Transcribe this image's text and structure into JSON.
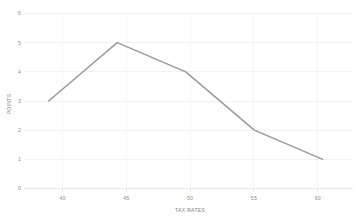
{
  "chart_data": {
    "type": "line",
    "title": "",
    "subtitle": "",
    "xlabel": "TAX RATES",
    "ylabel": "POINTS",
    "x": [
      40,
      45,
      50,
      55,
      60
    ],
    "categories": [
      "40",
      "45",
      "50",
      "55",
      "60"
    ],
    "values": [
      3,
      5,
      4,
      2,
      1
    ],
    "series": [
      {
        "name": "",
        "values": [
          3,
          5,
          4,
          2,
          1
        ],
        "color": "#9a9a9a"
      }
    ],
    "xlim": [
      38.2,
      62.2
    ],
    "ylim": [
      0,
      6
    ],
    "xticks": [
      "40",
      "45",
      "50",
      "55",
      "60"
    ],
    "yticks": [
      "0",
      "1",
      "2",
      "3",
      "4",
      "5",
      "6"
    ],
    "grid": true,
    "grid_axis": "both",
    "legend": false,
    "legend_position": "none",
    "annotations": [],
    "background_color": "#ffffff",
    "gridline_color": "#ededed",
    "tick_label_color": "#8a8a8a",
    "axis_title_color": "#7d7d7d",
    "line_color": "#9a9a9a"
  },
  "axes": {
    "y_title": "POINTS",
    "x_title": "TAX RATES",
    "y_tick_labels": [
      "6",
      "5",
      "4",
      "3",
      "2",
      "1",
      "0"
    ],
    "x_tick_labels": [
      "40",
      "45",
      "50",
      "55",
      "60"
    ]
  }
}
